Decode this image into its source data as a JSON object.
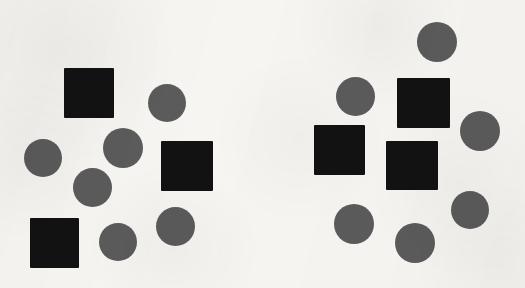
{
  "canvas": {
    "width": 525,
    "height": 288,
    "background_color": "#f6f5f2",
    "description": "scanned-paper visual stimulus with two clusters of black squares and gray circles"
  },
  "palette": {
    "square_color": "#121212",
    "circle_color": "#5b5b5b",
    "paper_color": "#f6f5f2"
  },
  "clusters": [
    {
      "name": "left-cluster",
      "square_count": 3,
      "circle_count": 7,
      "shapes": [
        {
          "kind": "square",
          "name": "square-1",
          "x": 64,
          "y": 68,
          "width": 50,
          "height": 50
        },
        {
          "kind": "circle",
          "name": "circle-1",
          "x": 148,
          "y": 84,
          "width": 38,
          "height": 38
        },
        {
          "kind": "circle",
          "name": "circle-2",
          "x": 103,
          "y": 128,
          "width": 40,
          "height": 40
        },
        {
          "kind": "circle",
          "name": "circle-3",
          "x": 24,
          "y": 139,
          "width": 38,
          "height": 38
        },
        {
          "kind": "square",
          "name": "square-2",
          "x": 161,
          "y": 141,
          "width": 52,
          "height": 50
        },
        {
          "kind": "circle",
          "name": "circle-4",
          "x": 73,
          "y": 168,
          "width": 39,
          "height": 39
        },
        {
          "kind": "circle",
          "name": "circle-5",
          "x": 156,
          "y": 207,
          "width": 39,
          "height": 39
        },
        {
          "kind": "square",
          "name": "square-3",
          "x": 30,
          "y": 218,
          "width": 49,
          "height": 50
        },
        {
          "kind": "circle",
          "name": "circle-6",
          "x": 99,
          "y": 223,
          "width": 38,
          "height": 38
        }
      ]
    },
    {
      "name": "right-cluster",
      "square_count": 3,
      "circle_count": 7,
      "shapes": [
        {
          "kind": "circle",
          "name": "circle-7",
          "x": 417,
          "y": 22,
          "width": 40,
          "height": 40
        },
        {
          "kind": "circle",
          "name": "circle-8",
          "x": 336,
          "y": 77,
          "width": 39,
          "height": 39
        },
        {
          "kind": "square",
          "name": "square-4",
          "x": 397,
          "y": 78,
          "width": 53,
          "height": 50
        },
        {
          "kind": "circle",
          "name": "circle-9",
          "x": 460,
          "y": 111,
          "width": 40,
          "height": 40
        },
        {
          "kind": "square",
          "name": "square-5",
          "x": 314,
          "y": 125,
          "width": 51,
          "height": 50
        },
        {
          "kind": "square",
          "name": "square-6",
          "x": 386,
          "y": 141,
          "width": 52,
          "height": 49
        },
        {
          "kind": "circle",
          "name": "circle-10",
          "x": 451,
          "y": 191,
          "width": 38,
          "height": 38
        },
        {
          "kind": "circle",
          "name": "circle-11",
          "x": 334,
          "y": 204,
          "width": 40,
          "height": 40
        },
        {
          "kind": "circle",
          "name": "circle-12",
          "x": 395,
          "y": 223,
          "width": 40,
          "height": 40
        }
      ]
    }
  ]
}
